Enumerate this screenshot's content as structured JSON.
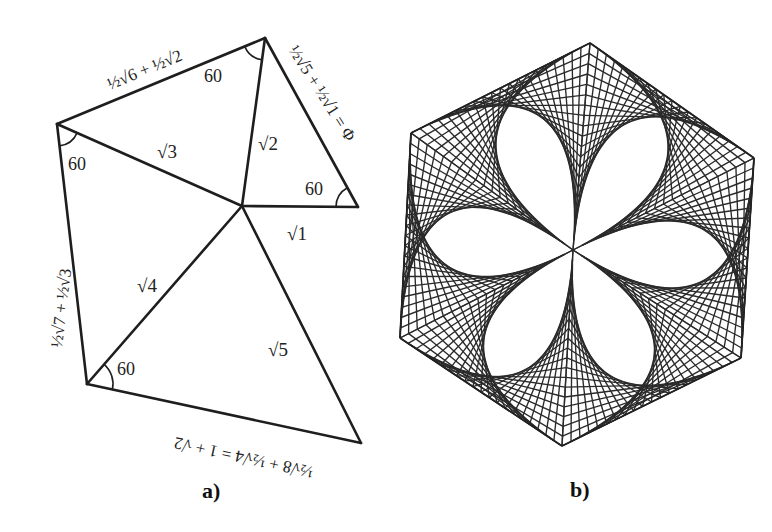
{
  "figure_a": {
    "caption": "a)",
    "vertices": {
      "center": [
        242,
        206
      ],
      "top": [
        265,
        38
      ],
      "left": [
        57,
        124
      ],
      "right": [
        358,
        207
      ],
      "bottom_left": [
        87,
        384
      ],
      "bottom_right": [
        361,
        443
      ]
    },
    "spoke_labels": {
      "sqrt1": "√1",
      "sqrt2": "√2",
      "sqrt3": "√3",
      "sqrt4": "√4",
      "sqrt5": "√5"
    },
    "angle_labels": {
      "top": "60",
      "left": "60",
      "right": "60",
      "bottom_left": "60"
    },
    "edge_labels": {
      "top_edge": "½√6 + ½√2",
      "right_edge": "½√5 + ½√1 = Φ",
      "left_edge": "½√7 + ½√3",
      "bottom_edge": "½√8 + ½√4 = 1 + √2"
    }
  },
  "figure_b": {
    "caption": "b)",
    "center": [
      573,
      250
    ],
    "hexagon": [
      [
        590,
        43
      ],
      [
        754,
        158
      ],
      [
        741,
        358
      ],
      [
        562,
        446
      ],
      [
        400,
        338
      ],
      [
        411,
        133
      ]
    ],
    "lines_per_sector": 20,
    "stroke_color": "#2a2a2a"
  }
}
